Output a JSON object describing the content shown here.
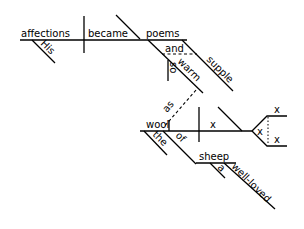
{
  "diagram": {
    "type": "sentence-diagram",
    "main_clause": {
      "subject": "affections",
      "subject_modifiers": [
        "His"
      ],
      "verb": "became",
      "complement": "poems",
      "complement_modifiers": {
        "conjunction": "and",
        "adjectives": [
          "warm",
          "supple"
        ],
        "adverb": "so"
      }
    },
    "subordinate_connector": "as",
    "subordinate_clause": {
      "subject": "wool",
      "subject_modifiers": [
        "the"
      ],
      "preposition": "of",
      "object": "sheep",
      "object_modifiers": [
        "a",
        "well-loved"
      ],
      "verb_placeholder": "x",
      "complement_placeholders": [
        "x",
        "x",
        "x"
      ]
    }
  },
  "labels": {
    "affections": "affections",
    "his": "His",
    "became": "became",
    "poems": "poems",
    "and": "and",
    "so": "so",
    "warm": "warm",
    "supple": "supple",
    "as": "as",
    "wool": "wool",
    "the": "the",
    "of": "of",
    "sheep": "sheep",
    "a": "a",
    "well_loved": "well-loved",
    "x_verb": "x",
    "x_upper": "x",
    "x_middle": "x",
    "x_lower": "x"
  }
}
